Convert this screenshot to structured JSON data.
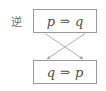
{
  "figure": {
    "label": {
      "text": "逆",
      "meaning": "converse-label"
    },
    "colors": {
      "background": "#ffffff",
      "border": "#9a9a9a",
      "text": "#4d4d4d",
      "label_text": "#6b6b6b",
      "arrow": "#a9a9a9"
    },
    "boxes": [
      {
        "id": "top",
        "antecedent": "p",
        "operator": "⇒",
        "consequent": "q"
      },
      {
        "id": "bottom",
        "antecedent": "q",
        "operator": "⇒",
        "consequent": "p"
      }
    ],
    "arrows": [
      {
        "id": "p-to-p",
        "from": "top-antecedent",
        "to": "bottom-consequent",
        "direction": "down-right"
      },
      {
        "id": "q-to-q",
        "from": "top-consequent",
        "to": "bottom-antecedent",
        "direction": "down-left"
      }
    ]
  }
}
